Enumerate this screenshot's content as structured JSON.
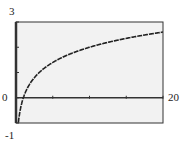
{
  "chart_data": {
    "type": "line",
    "title": "",
    "xlabel": "",
    "ylabel": "",
    "xlim": [
      0,
      20
    ],
    "ylim": [
      -1,
      3
    ],
    "x_tick_step": 5,
    "y_tick_step": 1,
    "grid": false,
    "window_labels": {
      "ymax": "3",
      "ymin": "-1",
      "xmin": "0",
      "xmax": "20"
    },
    "series": [
      {
        "name": "y = 2 log10(x)",
        "x": [
          0.25,
          0.5,
          1,
          2,
          3,
          4,
          5,
          6,
          8,
          10,
          12,
          14,
          16,
          18,
          20
        ],
        "values": [
          -1.2,
          -0.6,
          0,
          0.6,
          0.95,
          1.2,
          1.4,
          1.56,
          1.81,
          2.0,
          2.16,
          2.29,
          2.41,
          2.51,
          2.6
        ]
      }
    ]
  },
  "colors": {
    "frame": "#333333",
    "plot_bg": "#f2f2f2",
    "curve": "#222222"
  }
}
